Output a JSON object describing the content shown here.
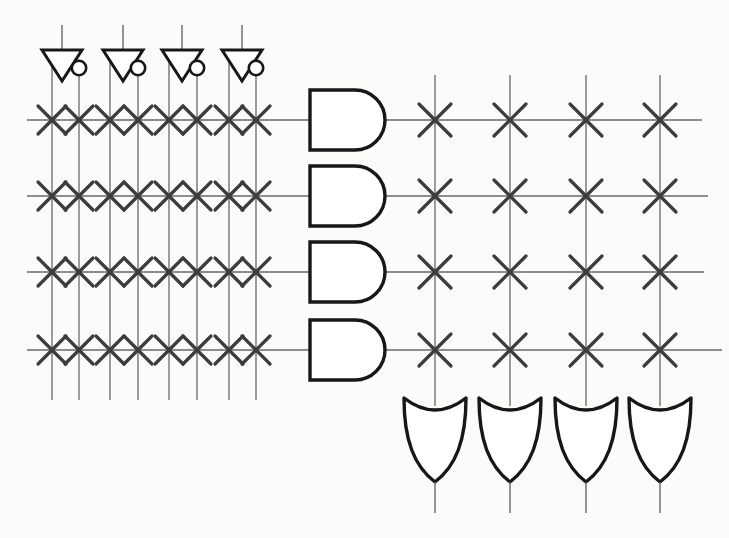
{
  "diagram": {
    "type": "pla-programmable-logic-array",
    "canvas": {
      "width": 729,
      "height": 538,
      "background": "#fbfbfa"
    },
    "colors": {
      "wire": "#686868",
      "cross": "#3c3c3c",
      "gate_stroke": "#171717",
      "gate_fill": "#ffffff"
    },
    "stroke_widths": {
      "wire": 1.3,
      "cross": 3.2,
      "gate": 3.4,
      "inverter": 3.0,
      "bubble": 2.6,
      "stub": 1.4
    },
    "inputs": {
      "count": 4,
      "inverters": [
        {
          "cx": 62,
          "true_line_x": 52,
          "complement_line_x": 79
        },
        {
          "cx": 123,
          "true_line_x": 110,
          "complement_line_x": 138
        },
        {
          "cx": 182,
          "true_line_x": 169,
          "complement_line_x": 197
        },
        {
          "cx": 242,
          "true_line_x": 229,
          "complement_line_x": 256
        }
      ],
      "geometry": {
        "stub_top_y": 25,
        "tri_top_y": 50,
        "tri_half_width": 20,
        "apex_y": 81,
        "bubble_center_y": 68,
        "bubble_radius": 7.2,
        "true_line_top_y": 54,
        "comp_line_top_y": 68
      }
    },
    "and_plane": {
      "columns_x": [
        52,
        79,
        110,
        138,
        169,
        197,
        229,
        256
      ],
      "rows_y": [
        120,
        196,
        272,
        350
      ],
      "row_x_start": 27,
      "col_y_bottom": 400,
      "cross_half": 14,
      "crosspoint_count": 32
    },
    "and_gates": {
      "count": 4,
      "x_flat_left": 310,
      "x_flat_right": 355,
      "radius": 30,
      "rows_y": [
        120,
        196,
        272,
        350
      ]
    },
    "or_plane": {
      "columns_x": [
        435,
        510,
        586,
        660
      ],
      "rows_y": [
        120,
        196,
        272,
        350
      ],
      "row_x_end": [
        702,
        708,
        704,
        722
      ],
      "col_y_top": 75,
      "col_y_bottom": 406,
      "cross_half": 16,
      "crosspoint_count": 16
    },
    "or_gates": {
      "count": 4,
      "centers_x": [
        435,
        510,
        586,
        660
      ],
      "top_y": 398,
      "half_width": 31,
      "concave_control_y": 422,
      "point_y": 482,
      "output_y": 513
    }
  }
}
